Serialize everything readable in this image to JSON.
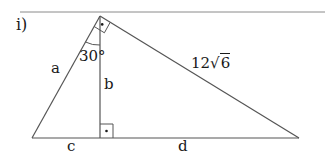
{
  "problem": {
    "label": "i)"
  },
  "figure": {
    "colors": {
      "stroke": "#555555",
      "text": "#1a1a1a",
      "rule": "#8a8a8a"
    },
    "vertices": {
      "apex": [
        100,
        16
      ],
      "left": [
        32,
        138
      ],
      "right": [
        299,
        138
      ],
      "foot": [
        100,
        138
      ]
    },
    "labels": {
      "side_a": "a",
      "side_b": "b",
      "side_c": "c",
      "side_d": "d",
      "angle": "30°",
      "hypotenuse_coeff": "12",
      "hypotenuse_radical": "√",
      "hypotenuse_radicand": "6"
    },
    "right_angle_marks": [
      "apex",
      "foot"
    ]
  }
}
